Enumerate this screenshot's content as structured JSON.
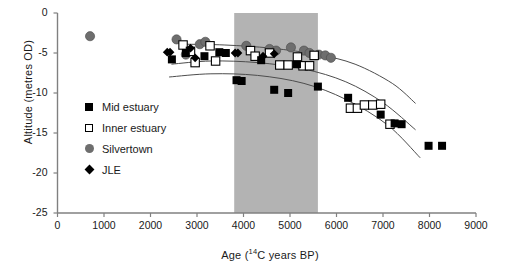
{
  "chart_data": {
    "type": "scatter",
    "title": "",
    "xlabel": "Age (14C years BP)",
    "xlabel_prefix": "Age (",
    "xlabel_sup": "14",
    "xlabel_suffix": "C years BP)",
    "ylabel": "Altitude (metres OD)",
    "xlim": [
      0,
      9000
    ],
    "ylim": [
      -25,
      0
    ],
    "xticks": [
      0,
      1000,
      2000,
      3000,
      4000,
      5000,
      6000,
      7000,
      8000,
      9000
    ],
    "yticks": [
      0,
      -5,
      -10,
      -15,
      -20,
      -25
    ],
    "grid": false,
    "legend_position": "inside-left",
    "shaded_band": {
      "label": "",
      "x_start": 3800,
      "x_end": 5600,
      "color": "#b3b3b3"
    },
    "series": [
      {
        "name": "Mid estuary",
        "marker": "filled-square",
        "color": "#000000",
        "points": [
          [
            2460,
            -5.8
          ],
          [
            2760,
            -5.0
          ],
          [
            3160,
            -5.4
          ],
          [
            3480,
            -4.9
          ],
          [
            3620,
            -5.0
          ],
          [
            3850,
            -8.4
          ],
          [
            3960,
            -8.5
          ],
          [
            4380,
            -5.9
          ],
          [
            4660,
            -9.6
          ],
          [
            4960,
            -10.0
          ],
          [
            5150,
            -6.4
          ],
          [
            5600,
            -9.2
          ],
          [
            6250,
            -10.6
          ],
          [
            6950,
            -12.7
          ],
          [
            7250,
            -13.8
          ],
          [
            7400,
            -13.9
          ],
          [
            7980,
            -16.6
          ],
          [
            8270,
            -16.6
          ]
        ]
      },
      {
        "name": "Inner estuary",
        "marker": "open-square",
        "color": "#000000",
        "points": [
          [
            2700,
            -4.0
          ],
          [
            2860,
            -4.8
          ],
          [
            2960,
            -6.2
          ],
          [
            3280,
            -4.1
          ],
          [
            3400,
            -6.0
          ],
          [
            4150,
            -4.7
          ],
          [
            4250,
            -5.4
          ],
          [
            4560,
            -5.0
          ],
          [
            4780,
            -6.5
          ],
          [
            4960,
            -6.5
          ],
          [
            5160,
            -5.5
          ],
          [
            5280,
            -6.6
          ],
          [
            5420,
            -6.6
          ],
          [
            5520,
            -5.3
          ],
          [
            6300,
            -11.9
          ],
          [
            6450,
            -11.9
          ],
          [
            6600,
            -11.5
          ],
          [
            6780,
            -11.5
          ],
          [
            6950,
            -11.4
          ],
          [
            7150,
            -13.9
          ]
        ]
      },
      {
        "name": "Silvertown",
        "marker": "filled-circle",
        "color": "#6e6e6e",
        "points": [
          [
            700,
            -2.9
          ],
          [
            2560,
            -3.3
          ],
          [
            2760,
            -5.2
          ],
          [
            3060,
            -3.9
          ],
          [
            3180,
            -3.6
          ],
          [
            4060,
            -4.1
          ],
          [
            4560,
            -4.5
          ],
          [
            4700,
            -4.7
          ],
          [
            5020,
            -4.3
          ],
          [
            5300,
            -4.7
          ],
          [
            5420,
            -5.0
          ],
          [
            5620,
            -5.2
          ],
          [
            5760,
            -5.3
          ],
          [
            5880,
            -5.6
          ]
        ]
      },
      {
        "name": "JLE",
        "marker": "filled-diamond",
        "color": "#000000",
        "points": [
          [
            2360,
            -4.9
          ],
          [
            2420,
            -4.9
          ],
          [
            2860,
            -4.4
          ],
          [
            2960,
            -5.6
          ],
          [
            3820,
            -5.0
          ],
          [
            3880,
            -5.0
          ],
          [
            4420,
            -5.4
          ],
          [
            4660,
            -5.1
          ]
        ]
      }
    ],
    "trend_curves": [
      {
        "name": "upper-bound-curve",
        "points": [
          [
            2700,
            -3.9
          ],
          [
            3600,
            -4.0
          ],
          [
            4600,
            -4.4
          ],
          [
            5600,
            -5.2
          ],
          [
            6400,
            -6.4
          ],
          [
            7200,
            -8.8
          ],
          [
            7700,
            -11.3
          ]
        ]
      },
      {
        "name": "middle-bound-curve",
        "points": [
          [
            2450,
            -6.4
          ],
          [
            3300,
            -6.0
          ],
          [
            4300,
            -6.2
          ],
          [
            5300,
            -7.0
          ],
          [
            6200,
            -8.6
          ],
          [
            7000,
            -11.2
          ],
          [
            7700,
            -14.6
          ]
        ]
      },
      {
        "name": "lower-bound-curve",
        "points": [
          [
            2400,
            -8.0
          ],
          [
            3300,
            -7.6
          ],
          [
            4300,
            -7.8
          ],
          [
            5300,
            -8.8
          ],
          [
            6200,
            -10.8
          ],
          [
            7100,
            -14.0
          ],
          [
            7800,
            -18.1
          ]
        ]
      }
    ]
  },
  "legend": {
    "items": [
      {
        "label": "Mid estuary",
        "symbol": "filled-square"
      },
      {
        "label": "Inner estuary",
        "symbol": "open-square"
      },
      {
        "label": "Silvertown",
        "symbol": "filled-circle"
      },
      {
        "label": "JLE",
        "symbol": "filled-diamond"
      }
    ]
  }
}
